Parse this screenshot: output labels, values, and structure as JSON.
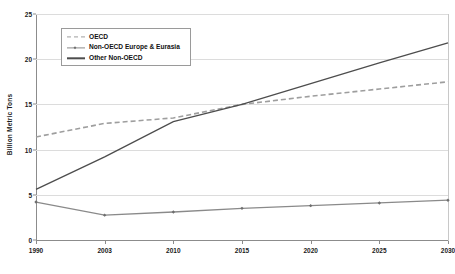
{
  "chart_data": {
    "type": "line",
    "title": "",
    "xlabel": "",
    "ylabel": "Billion Metric Tons",
    "categories": [
      "1990",
      "2003",
      "2010",
      "2015",
      "2020",
      "2025",
      "2030"
    ],
    "x": [
      1990,
      2003,
      2010,
      2015,
      2020,
      2025,
      2030
    ],
    "ylim": [
      0,
      25
    ],
    "yticks": [
      0,
      5,
      10,
      15,
      20,
      25
    ],
    "ytick_labels": [
      "0",
      "5",
      "10",
      "15",
      "20",
      "25"
    ],
    "grid": true,
    "legend_position": "upper-left-inside",
    "series": [
      {
        "name": "OECD",
        "style": "dashed",
        "color": "#9e9e9e",
        "markers": false,
        "values": [
          11.4,
          12.9,
          13.5,
          15.0,
          15.9,
          16.7,
          17.5
        ]
      },
      {
        "name": "Non-OECD Europe & Eurasia",
        "style": "solid",
        "color": "#8a8a8a",
        "markers": true,
        "values": [
          4.2,
          2.75,
          3.1,
          3.5,
          3.8,
          4.1,
          4.4
        ]
      },
      {
        "name": "Other Non-OECD",
        "style": "solid",
        "color": "#4d4d4d",
        "markers": false,
        "values": [
          5.6,
          9.2,
          13.1,
          15.0,
          17.3,
          19.6,
          21.8
        ]
      }
    ]
  },
  "axis": {
    "y_title": "Billion Metric Tons"
  },
  "legend": {
    "items": [
      {
        "label": "OECD"
      },
      {
        "label": "Non-OECD Europe & Eurasia"
      },
      {
        "label": "Other Non-OECD"
      }
    ]
  }
}
